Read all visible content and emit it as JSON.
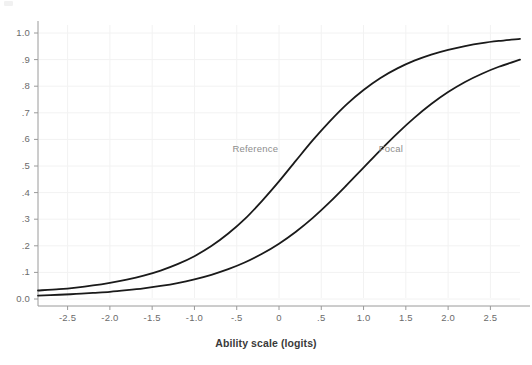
{
  "chart_data": {
    "type": "line",
    "title": "",
    "subtitle": "",
    "xlabel": "Ability scale (logits)",
    "ylabel": "",
    "xlim": [
      -2.85,
      2.85
    ],
    "ylim": [
      0.0,
      1.0
    ],
    "grid": true,
    "legend_position": "inline-annotation",
    "xticks": [
      -2.5,
      -2.0,
      -1.5,
      -1.0,
      -0.5,
      0.0,
      0.5,
      1.0,
      1.5,
      2.0,
      2.5
    ],
    "xticklabels": [
      "-2.5",
      "-2.0",
      "-1.5",
      "-1.0",
      "-.5",
      "0",
      ".5",
      "1.0",
      "1.5",
      "2.0",
      "2.5"
    ],
    "yticks": [
      0.0,
      0.1,
      0.2,
      0.3,
      0.4,
      0.5,
      0.6,
      0.7,
      0.8,
      0.9,
      1.0
    ],
    "yticklabels": [
      "0.0",
      ".1",
      ".2",
      ".3",
      ".4",
      ".5",
      ".6",
      ".7",
      ".8",
      ".9",
      "1.0"
    ],
    "annotations": [
      {
        "text": "Reference",
        "x": -0.55,
        "y": 0.565
      },
      {
        "text": "Focal",
        "x": 1.18,
        "y": 0.565
      }
    ],
    "series": [
      {
        "name": "Reference",
        "color": "#1a1a1a",
        "model": "logistic",
        "difficulty_b": -0.06,
        "discrimination_a": 1.55,
        "lower_asymptote_c": 0.02,
        "x": [
          -2.85,
          -2.6,
          -2.4,
          -2.2,
          -2.0,
          -1.8,
          -1.6,
          -1.4,
          -1.2,
          -1.0,
          -0.8,
          -0.6,
          -0.4,
          -0.2,
          0.0,
          0.2,
          0.4,
          0.6,
          0.8,
          1.0,
          1.2,
          1.4,
          1.6,
          1.8,
          2.0,
          2.2,
          2.4,
          2.6,
          2.85
        ],
        "y": [
          0.032,
          0.037,
          0.043,
          0.051,
          0.061,
          0.073,
          0.088,
          0.107,
          0.131,
          0.161,
          0.199,
          0.246,
          0.302,
          0.369,
          0.442,
          0.52,
          0.597,
          0.668,
          0.732,
          0.786,
          0.831,
          0.867,
          0.896,
          0.919,
          0.937,
          0.951,
          0.962,
          0.97,
          0.978
        ]
      },
      {
        "name": "Focal",
        "color": "#1a1a1a",
        "model": "logistic",
        "difficulty_b": 1.1,
        "discrimination_a": 1.42,
        "lower_asymptote_c": 0.01,
        "x": [
          -2.85,
          -2.6,
          -2.4,
          -2.2,
          -2.0,
          -1.8,
          -1.6,
          -1.4,
          -1.2,
          -1.0,
          -0.8,
          -0.6,
          -0.4,
          -0.2,
          0.0,
          0.2,
          0.4,
          0.6,
          0.8,
          1.0,
          1.2,
          1.4,
          1.6,
          1.8,
          2.0,
          2.2,
          2.4,
          2.6,
          2.85
        ],
        "y": [
          0.013,
          0.016,
          0.019,
          0.023,
          0.027,
          0.033,
          0.04,
          0.049,
          0.06,
          0.074,
          0.091,
          0.112,
          0.138,
          0.17,
          0.208,
          0.253,
          0.305,
          0.364,
          0.428,
          0.494,
          0.56,
          0.623,
          0.681,
          0.733,
          0.778,
          0.816,
          0.847,
          0.873,
          0.9
        ]
      }
    ]
  },
  "axis": {
    "x_title": "Ability scale (logits)"
  },
  "style": {
    "curve_color": "#1a1a1a",
    "grid_color": "#f2f2f2",
    "axis_color": "#9a9a9a",
    "tick_text_color": "#6b6b6b",
    "annotation_color": "#8d8d8d",
    "background": "#ffffff"
  }
}
